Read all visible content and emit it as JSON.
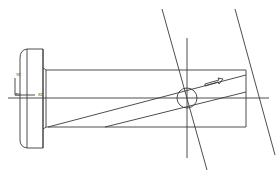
{
  "drawing": {
    "type": "technical-drawing",
    "description": "Pin with flanged head, helical slot, and section/view lines",
    "line_color": "#3a3a3a",
    "background": "#ffffff",
    "labels": {
      "yc": "YC",
      "zc": "ZC",
      "xc": "XC"
    }
  }
}
